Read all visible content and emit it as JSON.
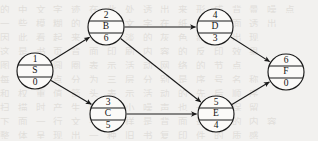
{
  "diagram": {
    "background_color": "#f2f1ef",
    "line_color": "#1a1a1a",
    "node_fill": "#fbfaf8",
    "node_radius": 18,
    "nodes": [
      {
        "id": "n1",
        "index": "1",
        "label": "S",
        "weight": "0",
        "cx": 35,
        "cy": 71
      },
      {
        "id": "n2",
        "index": "2",
        "label": "B",
        "weight": "6",
        "cx": 106,
        "cy": 27
      },
      {
        "id": "n3",
        "index": "3",
        "label": "C",
        "weight": "5",
        "cx": 108,
        "cy": 114
      },
      {
        "id": "n4",
        "index": "4",
        "label": "D",
        "weight": "3",
        "cx": 215,
        "cy": 27
      },
      {
        "id": "n5",
        "index": "5",
        "label": "E",
        "weight": "4",
        "cx": 216,
        "cy": 114
      },
      {
        "id": "n6",
        "index": "6",
        "label": "F",
        "weight": "0",
        "cx": 286,
        "cy": 72
      }
    ],
    "edges": [
      {
        "id": "e1",
        "from": "n1",
        "to": "n2"
      },
      {
        "id": "e2",
        "from": "n1",
        "to": "n3"
      },
      {
        "id": "e3",
        "from": "n2",
        "to": "n4"
      },
      {
        "id": "e4",
        "from": "n2",
        "to": "n5"
      },
      {
        "id": "e5",
        "from": "n3",
        "to": "n5"
      },
      {
        "id": "e6",
        "from": "n4",
        "to": "n6"
      },
      {
        "id": "e7",
        "from": "n5",
        "to": "n6"
      }
    ],
    "bleed_lines": [
      {
        "y": 2,
        "text": "的 中 文 字 迹 在 此 处 透 出 来 形 成 背 景 噪 点"
      },
      {
        "y": 16,
        "text": "一 些 模 糊 的 扫 描 文 字 在 纸 张 背 面 透 出"
      },
      {
        "y": 30,
        "text": "因 此 看 起 来 有 淡 淡 的 灰 色 痕 迹 出 现"
      },
      {
        "y": 44,
        "text": "这 是 书 页 背 面 印 刷 内 容 的 反 印 效 果"
      },
      {
        "y": 58,
        "text": "图 中 的 圆 圈 表 示 活 动 网 络 的 节 点"
      },
      {
        "y": 72,
        "text": "每 个 节 点 分 为 三 层 分 别 是 序 号 名 称"
      },
      {
        "y": 86,
        "text": "和 权 重 值 箭 头 表 示 活 动 的 先 后 顺 序"
      },
      {
        "y": 100,
        "text": "扫 描 时 产 生 的 细 小 噪 声 也 一 并 保 留"
      },
      {
        "y": 114,
        "text": "下 面 一 行 文 字 同 样 是 背 面 透 出 的 内 容"
      },
      {
        "y": 128,
        "text": "整 体 呈 现 出 一 种 旧 书 复 印 件 的 质 感"
      }
    ]
  }
}
